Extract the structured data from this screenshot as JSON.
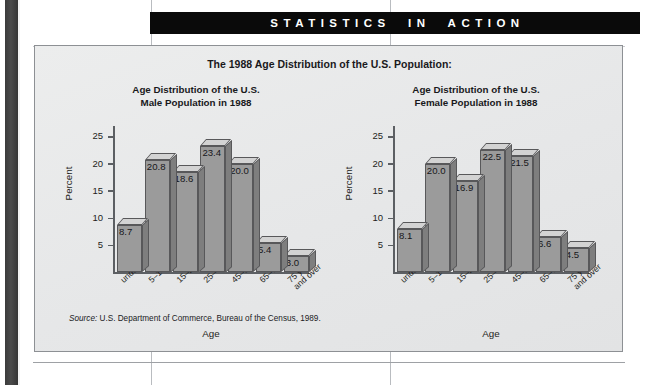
{
  "banner": {
    "label": "STATISTICS  IN  ACTION"
  },
  "figure": {
    "title": "The 1988 Age Distribution of the U.S. Population:",
    "source_label": "Source:",
    "source_text": " U.S. Department of Commerce, Bureau of the Census, 1989."
  },
  "chart_data": [
    {
      "type": "bar",
      "title": "Age Distribution of the U.S.\nMale Population in 1988",
      "title_line1": "Age Distribution of the U.S.",
      "title_line2": "Male Population in 1988",
      "xlabel": "Age",
      "ylabel": "Percent",
      "ylim": [
        0,
        27
      ],
      "yticks": [
        5,
        10,
        15,
        20,
        25
      ],
      "ytick_labels": [
        "5",
        "10",
        "15",
        "20",
        "25"
      ],
      "grid": false,
      "legend": "none",
      "categories": [
        "under 5 yrs",
        "5–14 yrs",
        "15–24 yrs",
        "25–44 yrs",
        "45–64 yrs",
        "65–74 yrs",
        "75 yrs\nand over"
      ],
      "values": [
        8.7,
        20.8,
        18.6,
        23.4,
        20.0,
        5.4,
        3.0
      ],
      "value_labels": [
        "8.7",
        "20.8",
        "18.6",
        "23.4",
        "20.0",
        "5.4",
        "3.0"
      ]
    },
    {
      "type": "bar",
      "title": "Age Distribution of the U.S.\nFemale Population in 1988",
      "title_line1": "Age Distribution of the U.S.",
      "title_line2": "Female Population in 1988",
      "xlabel": "Age",
      "ylabel": "Percent",
      "ylim": [
        0,
        27
      ],
      "yticks": [
        5,
        10,
        15,
        20,
        25
      ],
      "ytick_labels": [
        "5",
        "10",
        "15",
        "20",
        "25"
      ],
      "grid": false,
      "legend": "none",
      "categories": [
        "under 5 yrs",
        "5–14 yrs",
        "15–24 yrs",
        "25–44 yrs",
        "45–64 yrs",
        "65–74 yrs",
        "75 yrs\nand over"
      ],
      "values": [
        8.1,
        20.0,
        16.9,
        22.5,
        21.5,
        6.6,
        4.5
      ],
      "value_labels": [
        "8.1",
        "20.0",
        "16.9",
        "22.5",
        "21.5",
        "6.6",
        "4.5"
      ]
    }
  ],
  "colors": {
    "banner_bg": "#0a0a0a",
    "banner_text": "#ffffff",
    "figure_bg": "#e9eaeb",
    "bar_front": "#9b9b9b",
    "bar_top": "#d3d3d3",
    "bar_side": "#7e7e7e",
    "bar_outline": "#58585a",
    "axis": "#5c5f63",
    "spine": "#3b3b3b"
  }
}
